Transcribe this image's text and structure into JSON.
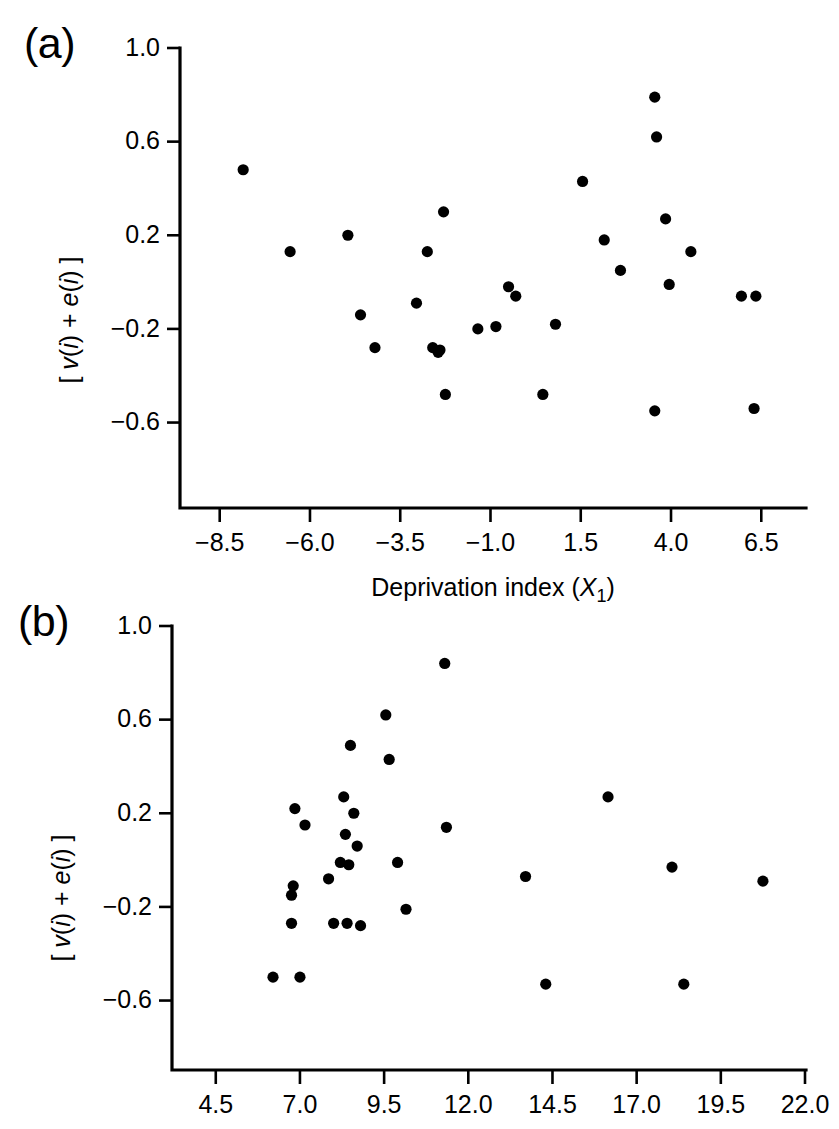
{
  "figure": {
    "background_color": "#ffffff",
    "point_color": "#000000",
    "axis_color": "#000000"
  },
  "panels": {
    "a": {
      "label": "(a)",
      "ylabel_parts": [
        "[ ",
        "v",
        "(",
        "i",
        ") + ",
        "e",
        "(",
        "i",
        ") ]"
      ],
      "ylabel_text": "[ v(i) + e(i) ]",
      "xlabel_text": "Deprivation index (X1)",
      "xlabel_main": "Deprivation index (",
      "xlabel_var": "X",
      "xlabel_sub": "1",
      "xlabel_close": ")"
    },
    "b": {
      "label": "(b)",
      "ylabel_text": "[ v(i) + e(i) ]"
    }
  },
  "chart_data": [
    {
      "type": "scatter",
      "panel": "a",
      "title": "(a)",
      "xlabel": "Deprivation index (X1)",
      "ylabel": "[ v(i) + e(i) ]",
      "xlim": [
        -9.6,
        7.7
      ],
      "ylim": [
        -0.76,
        1.0
      ],
      "xticks": [
        -8.5,
        -6.0,
        -3.5,
        -1.0,
        1.5,
        4.0,
        6.5
      ],
      "xticklabels": [
        "-8.5",
        "-6.0",
        "-3.5",
        "-1.0",
        "1.5",
        "4.0",
        "6.5"
      ],
      "yticks": [
        1.0,
        0.6,
        0.2,
        -0.2,
        -0.6
      ],
      "yticklabels": [
        "1.0",
        "0.6",
        "0.2",
        "-0.2",
        "-0.6"
      ],
      "grid": false,
      "legend": null,
      "n_points": 30,
      "points": [
        {
          "x": -7.85,
          "y": 0.48
        },
        {
          "x": -6.55,
          "y": 0.13
        },
        {
          "x": -4.95,
          "y": 0.2
        },
        {
          "x": -4.6,
          "y": -0.14
        },
        {
          "x": -4.2,
          "y": -0.28
        },
        {
          "x": -3.05,
          "y": -0.09
        },
        {
          "x": -2.75,
          "y": 0.13
        },
        {
          "x": -2.6,
          "y": -0.28
        },
        {
          "x": -2.45,
          "y": -0.3
        },
        {
          "x": -2.4,
          "y": -0.29
        },
        {
          "x": -2.3,
          "y": 0.3
        },
        {
          "x": -2.25,
          "y": -0.48
        },
        {
          "x": -1.35,
          "y": -0.2
        },
        {
          "x": -0.85,
          "y": -0.19
        },
        {
          "x": -0.5,
          "y": -0.02
        },
        {
          "x": -0.3,
          "y": -0.06
        },
        {
          "x": 0.45,
          "y": -0.48
        },
        {
          "x": 0.8,
          "y": -0.18
        },
        {
          "x": 1.55,
          "y": 0.43
        },
        {
          "x": 2.15,
          "y": 0.18
        },
        {
          "x": 2.6,
          "y": 0.05
        },
        {
          "x": 3.55,
          "y": 0.79
        },
        {
          "x": 3.6,
          "y": 0.62
        },
        {
          "x": 3.55,
          "y": -0.55
        },
        {
          "x": 3.85,
          "y": 0.27
        },
        {
          "x": 3.95,
          "y": -0.01
        },
        {
          "x": 4.55,
          "y": 0.13
        },
        {
          "x": 5.95,
          "y": -0.06
        },
        {
          "x": 6.35,
          "y": -0.06
        },
        {
          "x": 6.3,
          "y": -0.54
        }
      ]
    },
    {
      "type": "scatter",
      "panel": "b",
      "title": "(b)",
      "xlabel": "",
      "ylabel": "[ v(i) + e(i) ]",
      "xlim": [
        3.2,
        22.0
      ],
      "ylim": [
        -0.76,
        1.0
      ],
      "xticks": [
        4.5,
        7.0,
        9.5,
        12.0,
        14.5,
        17.0,
        19.5,
        22.0
      ],
      "xticklabels": [
        "4.5",
        "7.0",
        "9.5",
        "12.0",
        "14.5",
        "17.0",
        "19.5",
        "22.0"
      ],
      "yticks": [
        1.0,
        0.6,
        0.2,
        -0.2,
        -0.6
      ],
      "yticklabels": [
        "1.0",
        "0.6",
        "0.2",
        "-0.2",
        "-0.6"
      ],
      "grid": false,
      "legend": null,
      "n_points": 30,
      "points": [
        {
          "x": 6.2,
          "y": -0.5
        },
        {
          "x": 6.75,
          "y": -0.27
        },
        {
          "x": 6.75,
          "y": -0.15
        },
        {
          "x": 6.8,
          "y": -0.11
        },
        {
          "x": 6.85,
          "y": 0.22
        },
        {
          "x": 7.0,
          "y": -0.5
        },
        {
          "x": 7.15,
          "y": 0.15
        },
        {
          "x": 7.85,
          "y": -0.08
        },
        {
          "x": 8.0,
          "y": -0.27
        },
        {
          "x": 8.2,
          "y": -0.01
        },
        {
          "x": 8.3,
          "y": 0.27
        },
        {
          "x": 8.35,
          "y": 0.11
        },
        {
          "x": 8.4,
          "y": -0.27
        },
        {
          "x": 8.45,
          "y": -0.02
        },
        {
          "x": 8.5,
          "y": 0.49
        },
        {
          "x": 8.6,
          "y": 0.2
        },
        {
          "x": 8.7,
          "y": 0.06
        },
        {
          "x": 8.8,
          "y": -0.28
        },
        {
          "x": 9.55,
          "y": 0.62
        },
        {
          "x": 9.65,
          "y": 0.43
        },
        {
          "x": 9.9,
          "y": -0.01
        },
        {
          "x": 10.15,
          "y": -0.21
        },
        {
          "x": 11.3,
          "y": 0.84
        },
        {
          "x": 11.35,
          "y": 0.14
        },
        {
          "x": 13.7,
          "y": -0.07
        },
        {
          "x": 14.3,
          "y": -0.53
        },
        {
          "x": 16.15,
          "y": 0.27
        },
        {
          "x": 18.05,
          "y": -0.03
        },
        {
          "x": 18.4,
          "y": -0.53
        },
        {
          "x": 20.75,
          "y": -0.09
        }
      ]
    }
  ]
}
